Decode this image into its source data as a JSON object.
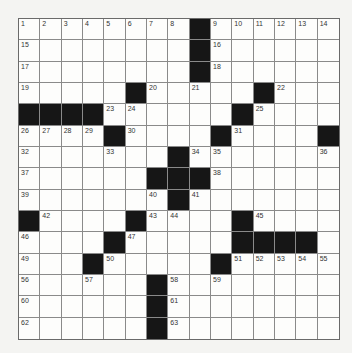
{
  "puzzle": {
    "size": 15,
    "colors": {
      "black_cell": "#161616",
      "white_cell": "#fdfdfc",
      "grid_line": "#8a8a8a"
    },
    "rows": [
      "........#......",
      "........#......",
      "........#......",
      ".....#.....#...",
      "####......#....",
      "....#....#....#",
      ".......#.......",
      "......###......",
      ".......#.......",
      "#....#....#....",
      "....#.....####.",
      "...#.....#.....",
      "......#........",
      "......#........",
      "......#........"
    ],
    "numbers": [
      [
        0,
        0,
        1
      ],
      [
        0,
        1,
        2
      ],
      [
        0,
        2,
        3
      ],
      [
        0,
        3,
        4
      ],
      [
        0,
        4,
        5
      ],
      [
        0,
        5,
        6
      ],
      [
        0,
        6,
        7
      ],
      [
        0,
        7,
        8
      ],
      [
        0,
        9,
        9
      ],
      [
        0,
        10,
        10
      ],
      [
        0,
        11,
        11
      ],
      [
        0,
        12,
        12
      ],
      [
        0,
        13,
        13
      ],
      [
        0,
        14,
        14
      ],
      [
        1,
        0,
        15
      ],
      [
        1,
        9,
        16
      ],
      [
        2,
        0,
        17
      ],
      [
        2,
        9,
        18
      ],
      [
        3,
        0,
        19
      ],
      [
        3,
        6,
        20
      ],
      [
        3,
        8,
        21
      ],
      [
        3,
        12,
        22
      ],
      [
        4,
        4,
        23
      ],
      [
        4,
        5,
        24
      ],
      [
        4,
        11,
        25
      ],
      [
        5,
        0,
        26
      ],
      [
        5,
        1,
        27
      ],
      [
        5,
        2,
        28
      ],
      [
        5,
        3,
        29
      ],
      [
        5,
        5,
        30
      ],
      [
        5,
        10,
        31
      ],
      [
        6,
        0,
        32
      ],
      [
        6,
        4,
        33
      ],
      [
        6,
        8,
        34
      ],
      [
        6,
        9,
        35
      ],
      [
        6,
        14,
        36
      ],
      [
        7,
        0,
        37
      ],
      [
        7,
        9,
        38
      ],
      [
        8,
        0,
        39
      ],
      [
        8,
        6,
        40
      ],
      [
        8,
        8,
        41
      ],
      [
        9,
        1,
        42
      ],
      [
        9,
        6,
        43
      ],
      [
        9,
        7,
        44
      ],
      [
        9,
        11,
        45
      ],
      [
        10,
        0,
        46
      ],
      [
        10,
        5,
        47
      ],
      [
        10,
        10,
        48
      ],
      [
        11,
        0,
        49
      ],
      [
        11,
        4,
        50
      ],
      [
        11,
        10,
        51
      ],
      [
        11,
        11,
        52
      ],
      [
        11,
        12,
        53
      ],
      [
        11,
        13,
        54
      ],
      [
        11,
        14,
        55
      ],
      [
        12,
        0,
        56
      ],
      [
        12,
        3,
        57
      ],
      [
        12,
        7,
        58
      ],
      [
        12,
        9,
        59
      ],
      [
        13,
        0,
        60
      ],
      [
        13,
        7,
        61
      ],
      [
        14,
        0,
        62
      ],
      [
        14,
        7,
        63
      ]
    ]
  }
}
